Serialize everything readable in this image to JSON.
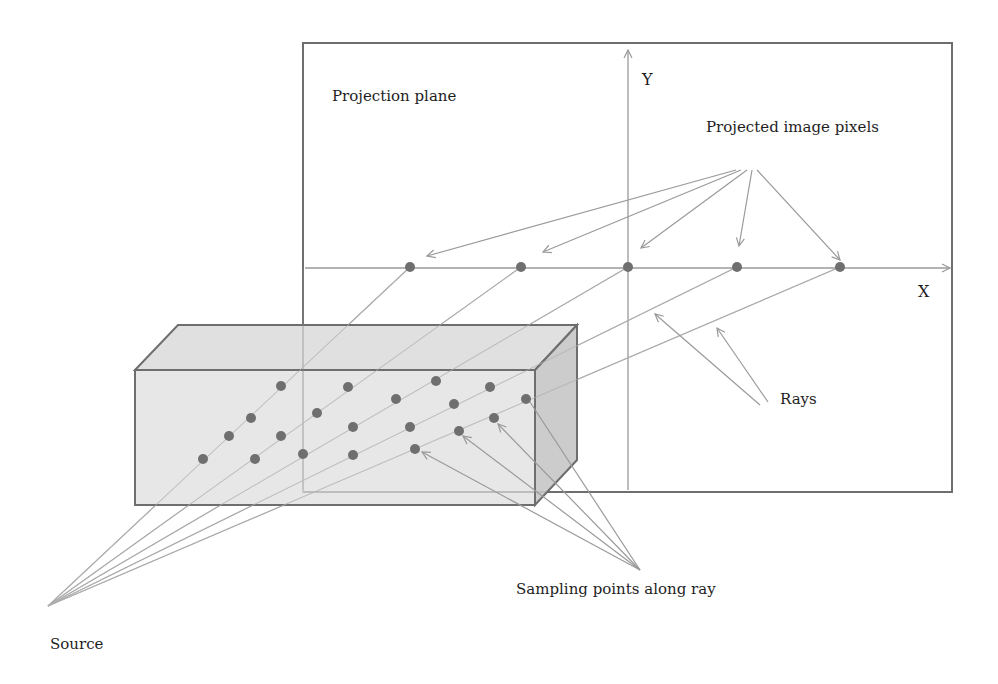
{
  "diagram": {
    "labels": {
      "projection_plane": "Projection plane",
      "y_axis": "Y",
      "x_axis": "X",
      "projected_pixels": "Projected image pixels",
      "rays": "Rays",
      "sampling_points": "Sampling points along ray",
      "source": "Source"
    },
    "colors": {
      "line": "#9a9a9a",
      "frame": "#6e6e6e",
      "dot": "#6f6f6f",
      "box_front": "#e2e2e2",
      "box_top": "#dadada",
      "box_side": "#c8c8c8"
    },
    "projected_pixel_count": 5,
    "sampling_point_count": 21
  }
}
